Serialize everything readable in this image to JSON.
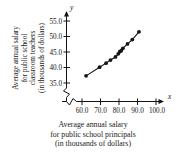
{
  "figure": {
    "title": "",
    "background_color": "#ffffff",
    "ink_color": "#141414"
  },
  "axis_names": {
    "x_symbol": "x",
    "y_symbol": "y"
  },
  "xlabel_lines": [
    "Average annual salary",
    "for public school principals",
    "(in thousands of dollars)"
  ],
  "ylabel_lines": [
    "Average annual salary",
    "for public school",
    "classroom teachers",
    "(in thousands of dollars)"
  ],
  "chart_data": {
    "type": "scatter",
    "title": "",
    "xlabel": "Average annual salary for public school principals (in thousands of dollars)",
    "ylabel": "Average annual salary for public school classroom teachers (in thousands of dollars)",
    "xticks": [
      "60.0",
      "70.0",
      "80.0",
      "90.0",
      "100.0"
    ],
    "xtick_values": [
      60.0,
      70.0,
      80.0,
      90.0,
      100.0
    ],
    "yticks": [
      "35.0",
      "40.0",
      "45.0",
      "50.0",
      "55.0"
    ],
    "ytick_values": [
      35.0,
      40.0,
      45.0,
      50.0,
      55.0
    ],
    "xlim": [
      57.0,
      103.0
    ],
    "ylim": [
      33.5,
      56.5
    ],
    "grid": false,
    "legend": null,
    "axis_break": true,
    "trend_line": true,
    "points": [
      {
        "x": 62.2,
        "y": 37.3
      },
      {
        "x": 69.5,
        "y": 40.1
      },
      {
        "x": 73.0,
        "y": 41.4
      },
      {
        "x": 75.4,
        "y": 42.4
      },
      {
        "x": 78.1,
        "y": 43.4
      },
      {
        "x": 79.6,
        "y": 44.4
      },
      {
        "x": 80.4,
        "y": 45.1
      },
      {
        "x": 81.2,
        "y": 45.4
      },
      {
        "x": 82.1,
        "y": 46.2
      },
      {
        "x": 84.6,
        "y": 47.6
      },
      {
        "x": 87.2,
        "y": 49.0
      },
      {
        "x": 90.8,
        "y": 51.5
      }
    ]
  }
}
